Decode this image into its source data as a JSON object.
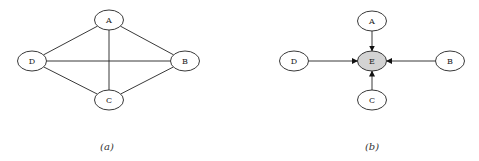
{
  "figure": {
    "panels": [
      {
        "id": "a",
        "caption": "(a)",
        "directed": false,
        "nodes": [
          {
            "id": "A",
            "label": "A",
            "cx": 109,
            "cy": 20,
            "highlight": false
          },
          {
            "id": "B",
            "label": "B",
            "cx": 185,
            "cy": 61,
            "highlight": false
          },
          {
            "id": "C",
            "label": "C",
            "cx": 109,
            "cy": 100,
            "highlight": false
          },
          {
            "id": "D",
            "label": "D",
            "cx": 32,
            "cy": 61,
            "highlight": false
          }
        ],
        "edges": [
          {
            "from": "A",
            "to": "B"
          },
          {
            "from": "A",
            "to": "C"
          },
          {
            "from": "A",
            "to": "D"
          },
          {
            "from": "B",
            "to": "C"
          },
          {
            "from": "B",
            "to": "D"
          },
          {
            "from": "C",
            "to": "D"
          }
        ]
      },
      {
        "id": "b",
        "caption": "(b)",
        "directed": true,
        "nodes": [
          {
            "id": "A",
            "label": "A",
            "cx": 372,
            "cy": 21,
            "highlight": false
          },
          {
            "id": "B",
            "label": "B",
            "cx": 450,
            "cy": 61,
            "highlight": false
          },
          {
            "id": "C",
            "label": "C",
            "cx": 372,
            "cy": 100,
            "highlight": false
          },
          {
            "id": "D",
            "label": "D",
            "cx": 294,
            "cy": 61,
            "highlight": false
          },
          {
            "id": "E",
            "label": "E",
            "cx": 372,
            "cy": 61,
            "highlight": true
          }
        ],
        "edges": [
          {
            "from": "A",
            "to": "E"
          },
          {
            "from": "B",
            "to": "E"
          },
          {
            "from": "C",
            "to": "E"
          },
          {
            "from": "D",
            "to": "E"
          }
        ]
      }
    ],
    "node_rx": 14.5,
    "node_ry": 10,
    "colors": {
      "stroke": "#222222",
      "node_fill": "#ffffff",
      "highlight_fill": "#d3d3d3"
    }
  }
}
